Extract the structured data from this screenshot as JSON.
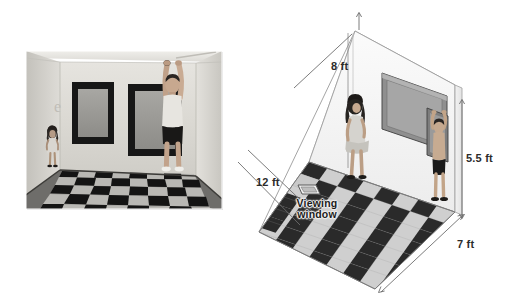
{
  "figure": {
    "panels": [
      {
        "name": "photograph",
        "caption": "",
        "description": "Grayscale photo of an Ames room interior: a small girl stands at the far left corner and a tall man stands at the near right corner, both against the back wall which holds two dark framed windows. The floor is a black-and-white checkerboard."
      },
      {
        "name": "diagram",
        "caption": "",
        "description": "Isometric line drawing of the same trapezoidal room showing its true shape, with dimension callouts and the viewing window position on the floor."
      }
    ]
  },
  "photo": {
    "frame_color": "#f3f3f3",
    "wall_color": "#d9d7d2",
    "floor_dark": "#141414",
    "floor_light": "#b9b8b4",
    "window_frame_color": "#1a1a1a",
    "window_glass_color": "#9b9a96",
    "people": [
      {
        "name": "girl",
        "pose": "standing, arms at side",
        "apparent_size": "small"
      },
      {
        "name": "man",
        "pose": "arms raised touching ceiling",
        "apparent_size": "large"
      }
    ],
    "windows_count": 2
  },
  "diagram": {
    "line_color": "#6f6f6f",
    "wall_fill": "#f4f4f4",
    "floor_dark": "#2a2a2a",
    "floor_light": "#c9c9c9",
    "dimensions": [
      {
        "id": "height-left",
        "label": "8 ft",
        "x": 331,
        "y": 66,
        "meaning": "height of far left wall"
      },
      {
        "id": "depth-left",
        "label": "12 ft",
        "x": 256,
        "y": 182,
        "meaning": "distance along left floor edge"
      },
      {
        "id": "height-right",
        "label": "5.5 ft",
        "x": 466,
        "y": 158,
        "meaning": "height of near right wall"
      },
      {
        "id": "width-front",
        "label": "7 ft",
        "x": 457,
        "y": 244,
        "meaning": "length of front right floor edge"
      }
    ],
    "annotations": [
      {
        "id": "viewing-window",
        "line1": "Viewing",
        "line2": "window",
        "x": 289,
        "y": 202,
        "marker_x": 306,
        "marker_y": 190
      }
    ],
    "people": [
      {
        "name": "girl",
        "pose": "standing at far wall",
        "apparent_size": "normal"
      },
      {
        "name": "man",
        "pose": "arms raised at near wall",
        "apparent_size": "normal"
      }
    ],
    "windows_count": 2
  }
}
